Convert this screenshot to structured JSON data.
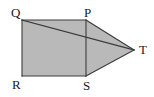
{
  "figure": {
    "background_color": "#ffffff",
    "fill_color": "#b9b9b9",
    "stroke_color": "#3c3c3c",
    "stroke_width": 1.1,
    "labels": {
      "Q": "Q",
      "P": "P",
      "T": "T",
      "R": "R",
      "S": "S"
    },
    "vertices": {
      "Q": {
        "x": 22,
        "y": 20
      },
      "P": {
        "x": 86,
        "y": 20
      },
      "T": {
        "x": 134,
        "y": 50
      },
      "S": {
        "x": 86,
        "y": 76
      },
      "R": {
        "x": 22,
        "y": 76
      }
    },
    "shapes": [
      {
        "name": "rectangle-QPSR",
        "points": "22,20 86,20 86,76 22,76",
        "filled": true
      },
      {
        "name": "triangle-PST",
        "points": "86,20 134,50 86,76",
        "filled": true
      }
    ],
    "segments": [
      {
        "name": "segment-QP",
        "x1": 22,
        "y1": 20,
        "x2": 86,
        "y2": 20
      },
      {
        "name": "segment-PS",
        "x1": 86,
        "y1": 20,
        "x2": 86,
        "y2": 76
      },
      {
        "name": "segment-SR",
        "x1": 86,
        "y1": 76,
        "x2": 22,
        "y2": 76
      },
      {
        "name": "segment-RQ",
        "x1": 22,
        "y1": 76,
        "x2": 22,
        "y2": 20
      },
      {
        "name": "segment-PT",
        "x1": 86,
        "y1": 20,
        "x2": 134,
        "y2": 50
      },
      {
        "name": "segment-ST",
        "x1": 86,
        "y1": 76,
        "x2": 134,
        "y2": 50
      },
      {
        "name": "segment-QT",
        "x1": 22,
        "y1": 20,
        "x2": 134,
        "y2": 50
      }
    ]
  }
}
